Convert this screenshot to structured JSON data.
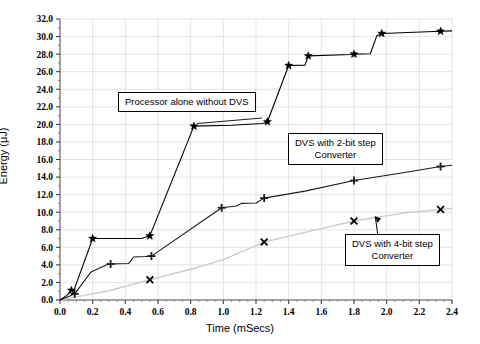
{
  "chart_data": {
    "type": "line",
    "title": "",
    "xlabel": "Time (mSecs)",
    "ylabel": "Energy (μJ)",
    "xlim": [
      0.0,
      2.4
    ],
    "ylim": [
      0.0,
      32.0
    ],
    "xticks": [
      "0.0",
      "0.2",
      "0.4",
      "0.6",
      "0.8",
      "1.0",
      "1.2",
      "1.4",
      "1.6",
      "1.8",
      "2.0",
      "2.2",
      "2.4"
    ],
    "yticks": [
      "0.0",
      "2.0",
      "4.0",
      "6.0",
      "8.0",
      "10.0",
      "12.0",
      "14.0",
      "16.0",
      "18.0",
      "20.0",
      "22.0",
      "24.0",
      "26.0",
      "28.0",
      "30.0",
      "32.0"
    ],
    "grid": true,
    "legend_position": "none",
    "series": [
      {
        "name": "Processor alone without DVS",
        "marker": "star",
        "color": "#000000",
        "points": [
          [
            0.0,
            0.0
          ],
          [
            0.04,
            0.5
          ],
          [
            0.07,
            1.1
          ],
          [
            0.085,
            1.1
          ],
          [
            0.2,
            7.0
          ],
          [
            0.5,
            7.0
          ],
          [
            0.53,
            7.2
          ],
          [
            0.55,
            7.3
          ],
          [
            0.82,
            19.8
          ],
          [
            1.05,
            19.9
          ],
          [
            1.24,
            20.1
          ],
          [
            1.27,
            20.3
          ],
          [
            1.4,
            26.7
          ],
          [
            1.5,
            26.75
          ],
          [
            1.52,
            27.8
          ],
          [
            1.78,
            27.95
          ],
          [
            1.8,
            28.0
          ],
          [
            1.9,
            28.05
          ],
          [
            1.94,
            30.1
          ],
          [
            1.97,
            30.35
          ],
          [
            2.33,
            30.6
          ],
          [
            2.4,
            30.65
          ]
        ],
        "marker_points": [
          [
            0.07,
            1.1
          ],
          [
            0.2,
            7.0
          ],
          [
            0.55,
            7.3
          ],
          [
            0.82,
            19.8
          ],
          [
            1.27,
            20.3
          ],
          [
            1.4,
            26.7
          ],
          [
            1.52,
            27.8
          ],
          [
            1.8,
            28.0
          ],
          [
            1.97,
            30.35
          ],
          [
            2.33,
            30.6
          ]
        ]
      },
      {
        "name": "DVS with 2-bit step Converter",
        "marker": "plus",
        "color": "#1a1a1a",
        "points": [
          [
            0.0,
            0.0
          ],
          [
            0.06,
            0.45
          ],
          [
            0.09,
            0.7
          ],
          [
            0.19,
            3.2
          ],
          [
            0.29,
            4.05
          ],
          [
            0.31,
            4.1
          ],
          [
            0.42,
            4.15
          ],
          [
            0.45,
            4.9
          ],
          [
            0.52,
            4.95
          ],
          [
            0.56,
            5.0
          ],
          [
            0.99,
            10.5
          ],
          [
            1.08,
            10.7
          ],
          [
            1.11,
            11.0
          ],
          [
            1.2,
            11.05
          ],
          [
            1.25,
            11.6
          ],
          [
            1.5,
            12.4
          ],
          [
            1.8,
            13.6
          ],
          [
            2.1,
            14.5
          ],
          [
            2.33,
            15.2
          ],
          [
            2.4,
            15.35
          ]
        ],
        "marker_points": [
          [
            0.09,
            0.7
          ],
          [
            0.31,
            4.1
          ],
          [
            0.56,
            5.0
          ],
          [
            0.99,
            10.5
          ],
          [
            1.25,
            11.6
          ],
          [
            1.8,
            13.6
          ],
          [
            2.33,
            15.2
          ]
        ]
      },
      {
        "name": "DVS with 4-bit step Converter",
        "marker": "cross",
        "color": "#cccccc",
        "points": [
          [
            0.0,
            0.0
          ],
          [
            0.1,
            0.35
          ],
          [
            0.3,
            1.05
          ],
          [
            0.55,
            2.3
          ],
          [
            0.8,
            3.5
          ],
          [
            1.0,
            4.6
          ],
          [
            1.25,
            6.6
          ],
          [
            1.5,
            7.7
          ],
          [
            1.8,
            9.0
          ],
          [
            2.1,
            9.9
          ],
          [
            2.33,
            10.3
          ],
          [
            2.4,
            10.45
          ]
        ],
        "marker_points": [
          [
            0.55,
            2.3
          ],
          [
            1.25,
            6.6
          ],
          [
            1.8,
            9.0
          ],
          [
            2.33,
            10.3
          ]
        ]
      }
    ],
    "annotations": [
      {
        "id": "processor",
        "text_lines": [
          "Processor alone without DVS"
        ],
        "points_to": [
          0.84,
          20.0
        ]
      },
      {
        "id": "twobit",
        "text_lines": [
          "DVS with 2-bit step",
          "Converter"
        ],
        "points_to": [
          1.25,
          11.6
        ]
      },
      {
        "id": "fourbit",
        "text_lines": [
          "DVS with 4-bit step",
          "Converter"
        ],
        "points_to": [
          1.93,
          9.4
        ]
      }
    ]
  },
  "axes": {
    "xlabel": "Time (mSecs)",
    "ylabel": "Energy (μJ)"
  },
  "callouts": {
    "processor": "Processor alone without DVS",
    "twobit_line1": "DVS with 2-bit step",
    "twobit_line2": "Converter",
    "fourbit_line1": "DVS with 4-bit step",
    "fourbit_line2": "Converter"
  }
}
